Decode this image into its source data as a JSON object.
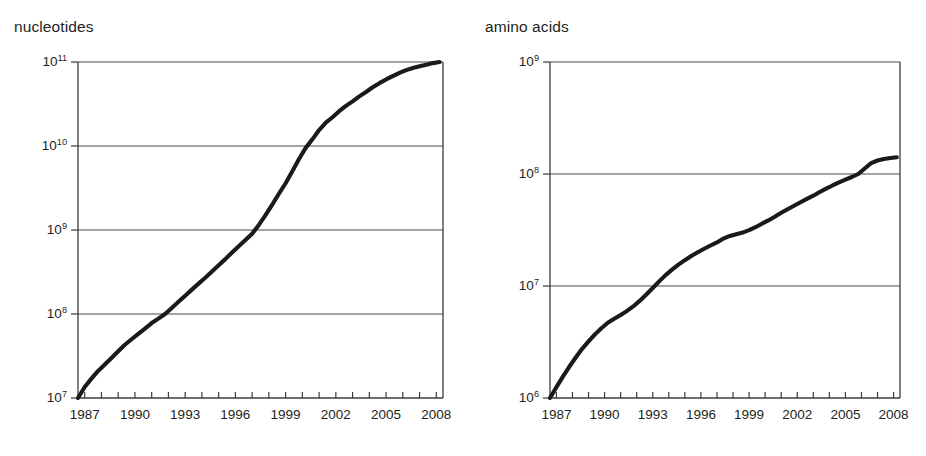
{
  "figure": {
    "background": "#ffffff",
    "ink_color": "#231f20",
    "curve_color": "#1a1a1a"
  },
  "panels": [
    {
      "key": "nucleotides",
      "title": "nucleotides"
    },
    {
      "key": "amino_acids",
      "title": "amino acids"
    }
  ],
  "chart_data": [
    {
      "type": "line",
      "title": "nucleotides",
      "xlabel": "",
      "ylabel": "nucleotides",
      "yscale": "log",
      "ylim": [
        10000000,
        100000000000
      ],
      "xlim": [
        1986.6,
        2008.4
      ],
      "grid": true,
      "legend": null,
      "ytick_labels": [
        "10⁷",
        "10⁸",
        "10⁹",
        "10¹⁰",
        "10¹¹"
      ],
      "ytick_values": [
        10000000,
        100000000,
        1000000000,
        10000000000,
        100000000000
      ],
      "xtick_labels": [
        "1987",
        "1990",
        "1993",
        "1996",
        "1999",
        "2002",
        "2005",
        "2008"
      ],
      "xtick_values": [
        1987,
        1990,
        1993,
        1996,
        1999,
        2002,
        2005,
        2008
      ],
      "x_minor_ticks": [
        1987,
        1988,
        1989,
        1990,
        1991,
        1992,
        1993,
        1994,
        1995,
        1996,
        1997,
        1998,
        1999,
        2000,
        2001,
        2002,
        2003,
        2004,
        2005,
        2006,
        2007,
        2008
      ],
      "x": [
        1986.6,
        1987.0,
        1987.4,
        1987.8,
        1988.2,
        1988.6,
        1989.0,
        1989.4,
        1989.8,
        1990.2,
        1990.6,
        1991.0,
        1991.4,
        1991.8,
        1992.2,
        1992.6,
        1993.0,
        1993.4,
        1993.8,
        1994.2,
        1994.6,
        1995.0,
        1995.4,
        1995.8,
        1996.2,
        1996.6,
        1997.0,
        1997.4,
        1997.8,
        1998.2,
        1998.6,
        1999.0,
        1999.4,
        1999.8,
        2000.2,
        2000.6,
        2001.0,
        2001.4,
        2001.8,
        2002.2,
        2002.6,
        2003.0,
        2003.4,
        2003.8,
        2004.2,
        2004.6,
        2005.0,
        2005.4,
        2005.8,
        2006.2,
        2006.6,
        2007.0,
        2007.4,
        2007.8,
        2008.2
      ],
      "y": [
        10000000,
        13500000,
        17000000,
        21000000,
        25000000,
        30000000,
        36000000,
        43000000,
        50000000,
        58000000,
        67000000,
        78000000,
        88000000,
        100000000,
        118000000,
        140000000,
        165000000,
        195000000,
        230000000,
        270000000,
        320000000,
        380000000,
        450000000,
        540000000,
        640000000,
        760000000,
        900000000,
        1150000000,
        1500000000,
        2000000000,
        2700000000,
        3600000000,
        5000000000,
        7000000000,
        9500000000,
        12000000000,
        15500000000,
        19000000000,
        22000000000,
        26000000000,
        30000000000,
        34000000000,
        39000000000,
        44000000000,
        50000000000,
        56000000000,
        62000000000,
        68000000000,
        74000000000,
        80000000000,
        85000000000,
        89000000000,
        93000000000,
        97000000000,
        100000000000
      ]
    },
    {
      "type": "line",
      "title": "amino acids",
      "xlabel": "",
      "ylabel": "amino acids",
      "yscale": "log",
      "ylim": [
        1000000,
        1000000000
      ],
      "xlim": [
        1986.6,
        2008.4
      ],
      "grid": true,
      "legend": null,
      "ytick_labels": [
        "10⁶",
        "10⁷",
        "10⁸",
        "10⁹"
      ],
      "ytick_values": [
        1000000,
        10000000,
        100000000,
        1000000000
      ],
      "xtick_labels": [
        "1987",
        "1990",
        "1993",
        "1996",
        "1999",
        "2002",
        "2005",
        "2008"
      ],
      "xtick_values": [
        1987,
        1990,
        1993,
        1996,
        1999,
        2002,
        2005,
        2008
      ],
      "x_minor_ticks": [
        1987,
        1988,
        1989,
        1990,
        1991,
        1992,
        1993,
        1994,
        1995,
        1996,
        1997,
        1998,
        1999,
        2000,
        2001,
        2002,
        2003,
        2004,
        2005,
        2006,
        2007,
        2008
      ],
      "x": [
        1986.6,
        1987.0,
        1987.4,
        1987.8,
        1988.2,
        1988.6,
        1989.0,
        1989.4,
        1989.8,
        1990.2,
        1990.6,
        1991.0,
        1991.4,
        1991.8,
        1992.2,
        1992.6,
        1993.0,
        1993.4,
        1993.8,
        1994.2,
        1994.6,
        1995.0,
        1995.4,
        1995.8,
        1996.2,
        1996.6,
        1997.0,
        1997.4,
        1997.8,
        1998.2,
        1998.6,
        1999.0,
        1999.4,
        1999.8,
        2000.2,
        2000.6,
        2001.0,
        2001.4,
        2001.8,
        2002.2,
        2002.6,
        2003.0,
        2003.4,
        2003.8,
        2004.2,
        2004.6,
        2005.0,
        2005.4,
        2005.8,
        2006.2,
        2006.6,
        2007.0,
        2007.4,
        2007.8,
        2008.2
      ],
      "y": [
        1000000,
        1250000,
        1550000,
        1900000,
        2300000,
        2750000,
        3200000,
        3700000,
        4200000,
        4700000,
        5100000,
        5500000,
        6000000,
        6600000,
        7400000,
        8400000,
        9600000,
        11000000,
        12500000,
        14000000,
        15500000,
        17000000,
        18500000,
        20000000,
        21500000,
        23000000,
        24500000,
        26500000,
        28000000,
        29000000,
        30000000,
        31500000,
        33500000,
        36000000,
        38500000,
        41500000,
        45000000,
        48500000,
        52000000,
        56000000,
        60000000,
        64000000,
        69000000,
        74000000,
        79000000,
        84000000,
        89000000,
        94000000,
        100000000,
        112000000,
        125000000,
        132000000,
        136000000,
        139000000,
        141000000
      ]
    }
  ]
}
